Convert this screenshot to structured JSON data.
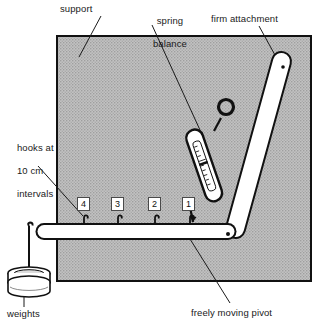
{
  "diagram": {
    "colors": {
      "support_fill": "#b9b9b9",
      "outline": "#111111",
      "object_fill": "#ffffff",
      "text": "#1a1a1a"
    },
    "labels": {
      "support": "support",
      "spring_balance_line1": "spring",
      "spring_balance_line2": "balance",
      "firm_attachment": "firm attachment",
      "hooks_line1": "hooks at",
      "hooks_line2": "10 cm",
      "hooks_line3": "intervals",
      "weights": "weights",
      "freely_moving_pivot": "freely moving pivot"
    },
    "hook_numbers": [
      "4",
      "3",
      "2",
      "1"
    ],
    "parts": [
      "support",
      "spring balance",
      "firm attachment",
      "freely moving pivot",
      "weights",
      "horizontal lever bar",
      "diagonal strut"
    ]
  }
}
